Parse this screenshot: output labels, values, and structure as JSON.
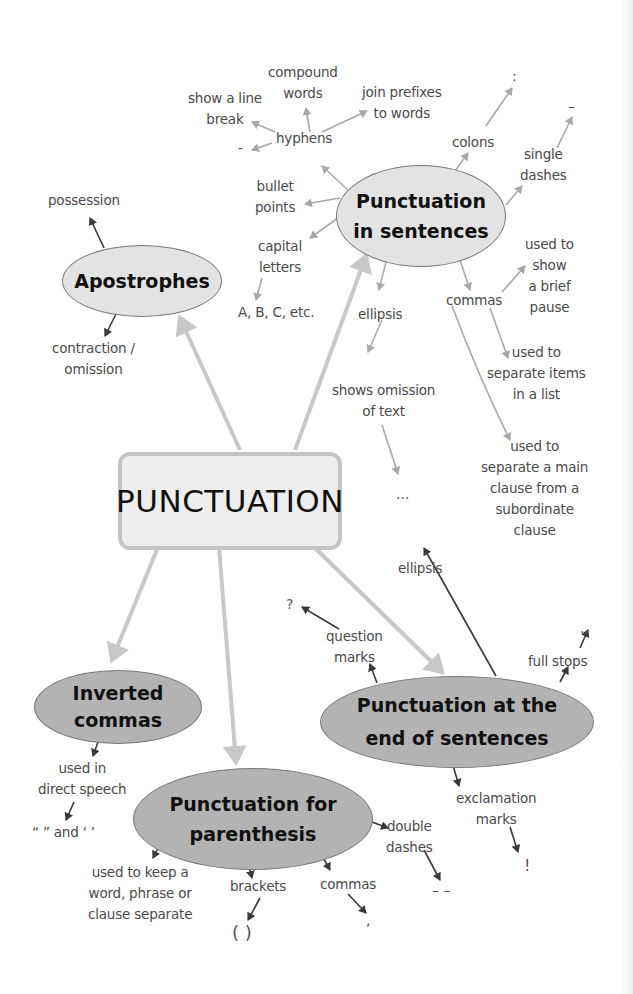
{
  "central": {
    "label": "PUNCTUATION"
  },
  "nodes": {
    "in_sentences": {
      "line1": "Punctuation",
      "line2": "in sentences"
    },
    "apostrophes": {
      "label": "Apostrophes"
    },
    "inverted_commas": {
      "line1": "Inverted",
      "line2": "commas"
    },
    "parenthesis": {
      "line1": "Punctuation for",
      "line2": "parenthesis"
    },
    "end_of_sentences": {
      "line1": "Punctuation at the",
      "line2": "end of sentences"
    }
  },
  "labels": {
    "compound_words": [
      "compound",
      "words"
    ],
    "join_prefixes": [
      "join prefixes",
      "to words"
    ],
    "show_line_break": [
      "show a line",
      "break"
    ],
    "hyphens": "hyphens",
    "hyphen_symbol": "-",
    "colons": "colons",
    "colon_symbol": ":",
    "single_dashes": [
      "single",
      "dashes"
    ],
    "single_dash_symbol": "–",
    "bullet_points": [
      "bullet",
      "points"
    ],
    "capital_letters": [
      "capital",
      "letters"
    ],
    "abc": "A, B, C, etc.",
    "commas": "commas",
    "brief_pause": [
      "used to",
      "show",
      "a brief",
      "pause"
    ],
    "separate_items": [
      "used to",
      "separate items",
      "in a list"
    ],
    "separate_clause": [
      "used to",
      "separate a main",
      "clause from a",
      "subordinate",
      "clause"
    ],
    "ellipsis": "ellipsis",
    "shows_omission": [
      "shows omission",
      "of text"
    ],
    "ellipsis_symbol": "...",
    "possession": "possession",
    "contraction": [
      "contraction /",
      "omission"
    ],
    "ellipsis_end": "ellipsis",
    "question_mark_symbol": "?",
    "question_marks": [
      "question",
      "marks"
    ],
    "full_stops": "full stops",
    "full_stop_symbol": ".",
    "exclamation_marks": [
      "exclamation",
      "marks"
    ],
    "exclamation_symbol": "!",
    "direct_speech": [
      "used in",
      "direct speech"
    ],
    "quote_marks": "“ ” and ‘ ’",
    "keep_separate": [
      "used to keep a",
      "word, phrase or",
      "clause separate"
    ],
    "brackets": "brackets",
    "brackets_symbol": "(   )",
    "commas_paren": "commas",
    "comma_symbol": ",",
    "double_dashes": [
      "double",
      "dashes"
    ],
    "double_dash_symbol": "–  –"
  },
  "colors": {
    "thick_arrow": "#c8c8c8",
    "light_arrow": "#a8a8a8",
    "dark_arrow": "#3a3a3a",
    "light_node": "#e3e3e3",
    "dark_node": "#b3b3b3"
  }
}
